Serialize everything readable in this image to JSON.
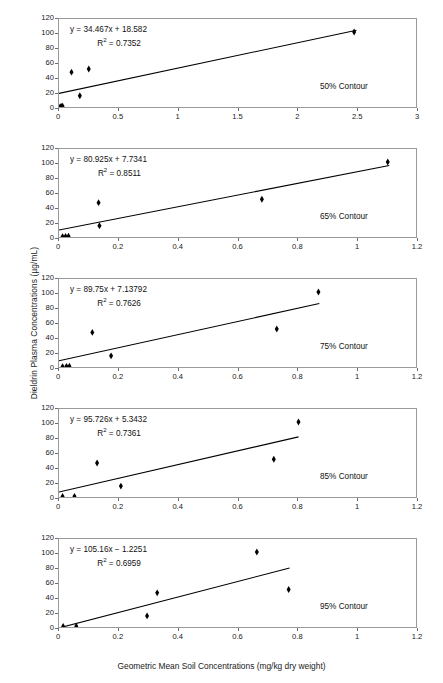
{
  "figure": {
    "ylabel": "Dieldrin Plasma Concentrations (µg/mL)",
    "xlabel": "Geometric Mean Soil Concentrations (mg/kg dry weight)"
  },
  "chart_data": [
    {
      "type": "scatter",
      "panel_id": "panel-50",
      "title": "",
      "annotation_label": "50% Contour",
      "equation": "y = 34.467x + 18.582",
      "r2_label": "R",
      "r2_sup": "2",
      "r2_value": "= 0.7352",
      "slope": 34.467,
      "intercept": 18.582,
      "r2": 0.7352,
      "xlabel": "",
      "ylabel": "",
      "xlim": [
        0,
        3
      ],
      "ylim": [
        0,
        120
      ],
      "xticks": [
        "0",
        "0.5",
        "1",
        "1.5",
        "2",
        "2.5",
        "3"
      ],
      "xtick_values": [
        0,
        0.5,
        1,
        1.5,
        2,
        2.5,
        3
      ],
      "yticks": [
        "0",
        "20",
        "40",
        "60",
        "80",
        "100",
        "120"
      ],
      "ytick_values": [
        0,
        20,
        40,
        60,
        80,
        100,
        120
      ],
      "grid": false,
      "legend": "none",
      "fit_line": {
        "x0": 0.0,
        "y0": 18.582,
        "x1": 2.5,
        "y1": 104.75
      },
      "points": [
        {
          "x": 0.01,
          "y": 0.6
        },
        {
          "x": 0.02,
          "y": 0.8
        },
        {
          "x": 0.03,
          "y": 1.0
        },
        {
          "x": 0.105,
          "y": 47.5
        },
        {
          "x": 0.175,
          "y": 15.3
        },
        {
          "x": 0.25,
          "y": 51.8
        },
        {
          "x": 2.48,
          "y": 102.3
        }
      ]
    },
    {
      "type": "scatter",
      "panel_id": "panel-65",
      "title": "",
      "annotation_label": "65% Contour",
      "equation": "y = 80.925x + 7.7341",
      "r2_label": "R",
      "r2_sup": "2",
      "r2_value": "= 0.8511",
      "slope": 80.925,
      "intercept": 7.7341,
      "r2": 0.8511,
      "xlabel": "",
      "ylabel": "",
      "xlim": [
        0,
        1.2
      ],
      "ylim": [
        0,
        120
      ],
      "xticks": [
        "0",
        "0.2",
        "0.4",
        "0.6",
        "0.8",
        "1",
        "1.2"
      ],
      "xtick_values": [
        0,
        0.2,
        0.4,
        0.6,
        0.8,
        1,
        1.2
      ],
      "yticks": [
        "0",
        "20",
        "40",
        "60",
        "80",
        "100",
        "120"
      ],
      "ytick_values": [
        0,
        20,
        40,
        60,
        80,
        100,
        120
      ],
      "grid": false,
      "legend": "none",
      "fit_line": {
        "x0": 0.0,
        "y0": 9.5,
        "x1": 1.11,
        "y1": 97.5
      },
      "points": [
        {
          "x": 0.012,
          "y": 0.6
        },
        {
          "x": 0.022,
          "y": 0.8
        },
        {
          "x": 0.032,
          "y": 1.0
        },
        {
          "x": 0.133,
          "y": 46.8
        },
        {
          "x": 0.136,
          "y": 15.3
        },
        {
          "x": 0.682,
          "y": 51.5
        },
        {
          "x": 1.105,
          "y": 102.3
        }
      ]
    },
    {
      "type": "scatter",
      "panel_id": "panel-75",
      "title": "",
      "annotation_label": "75% Contour",
      "equation": "y = 89.75x + 7.13792",
      "r2_label": "R",
      "r2_sup": "2",
      "r2_value": "= 0.7626",
      "slope": 89.75,
      "intercept": 7.13792,
      "r2": 0.7626,
      "xlabel": "",
      "ylabel": "",
      "xlim": [
        0,
        1.2
      ],
      "ylim": [
        0,
        120
      ],
      "xticks": [
        "0",
        "0.2",
        "0.4",
        "0.6",
        "0.8",
        "1",
        "1.2"
      ],
      "xtick_values": [
        0,
        0.2,
        0.4,
        0.6,
        0.8,
        1,
        1.2
      ],
      "yticks": [
        "0",
        "20",
        "40",
        "60",
        "80",
        "100",
        "120"
      ],
      "ytick_values": [
        0,
        20,
        40,
        60,
        80,
        100,
        120
      ],
      "grid": false,
      "legend": "none",
      "fit_line": {
        "x0": 0.0,
        "y0": 8.5,
        "x1": 0.875,
        "y1": 86.5
      },
      "points": [
        {
          "x": 0.012,
          "y": 0.6
        },
        {
          "x": 0.025,
          "y": 0.9
        },
        {
          "x": 0.035,
          "y": 1.1
        },
        {
          "x": 0.112,
          "y": 47.2
        },
        {
          "x": 0.175,
          "y": 15.2
        },
        {
          "x": 0.732,
          "y": 51.8
        },
        {
          "x": 0.872,
          "y": 102.3
        }
      ]
    },
    {
      "type": "scatter",
      "panel_id": "panel-85",
      "title": "",
      "annotation_label": "85% Contour",
      "equation": "y = 95.726x + 5.3432",
      "r2_label": "R",
      "r2_sup": "2",
      "r2_value": "= 0.7361",
      "slope": 95.726,
      "intercept": 5.3432,
      "r2": 0.7361,
      "xlabel": "",
      "ylabel": "",
      "xlim": [
        0,
        1.2
      ],
      "ylim": [
        0,
        120
      ],
      "xticks": [
        "0",
        "0.2",
        "0.4",
        "0.6",
        "0.8",
        "1",
        "1.2"
      ],
      "xtick_values": [
        0,
        0.2,
        0.4,
        0.6,
        0.8,
        1,
        1.2
      ],
      "yticks": [
        "0",
        "20",
        "40",
        "60",
        "80",
        "100",
        "120"
      ],
      "ytick_values": [
        0,
        20,
        40,
        60,
        80,
        100,
        120
      ],
      "grid": false,
      "legend": "none",
      "fit_line": {
        "x0": 0.0,
        "y0": 6.8,
        "x1": 0.805,
        "y1": 82.0
      },
      "points": [
        {
          "x": 0.012,
          "y": 0.7
        },
        {
          "x": 0.052,
          "y": 0.9
        },
        {
          "x": 0.128,
          "y": 46.3
        },
        {
          "x": 0.208,
          "y": 14.9
        },
        {
          "x": 0.722,
          "y": 51.5
        },
        {
          "x": 0.805,
          "y": 102.3
        }
      ]
    },
    {
      "type": "scatter",
      "panel_id": "panel-95",
      "title": "",
      "annotation_label": "95% Contour",
      "equation": "y = 105.16x − 1.2251",
      "r2_label": "R",
      "r2_sup": "2",
      "r2_value": "= 0.6959",
      "slope": 105.16,
      "intercept": -1.2251,
      "r2": 0.6959,
      "xlabel": "Geometric Mean Soil Concentrations (mg/kg dry weight)",
      "ylabel": "",
      "xlim": [
        0,
        1.2
      ],
      "ylim": [
        0,
        120
      ],
      "xticks": [
        "0",
        "0.2",
        "0.4",
        "0.6",
        "0.8",
        "1",
        "1.2"
      ],
      "xtick_values": [
        0,
        0.2,
        0.4,
        0.6,
        0.8,
        1,
        1.2
      ],
      "yticks": [
        "0",
        "20",
        "40",
        "60",
        "80",
        "100",
        "120"
      ],
      "ytick_values": [
        0,
        20,
        40,
        60,
        80,
        100,
        120
      ],
      "grid": false,
      "legend": "none",
      "fit_line": {
        "x0": 0.018,
        "y0": 0.6,
        "x1": 0.775,
        "y1": 80.5
      },
      "points": [
        {
          "x": 0.014,
          "y": 0.8
        },
        {
          "x": 0.058,
          "y": 1.0
        },
        {
          "x": 0.296,
          "y": 15.1
        },
        {
          "x": 0.33,
          "y": 46.6
        },
        {
          "x": 0.665,
          "y": 102.3
        },
        {
          "x": 0.772,
          "y": 51.2
        }
      ]
    }
  ]
}
